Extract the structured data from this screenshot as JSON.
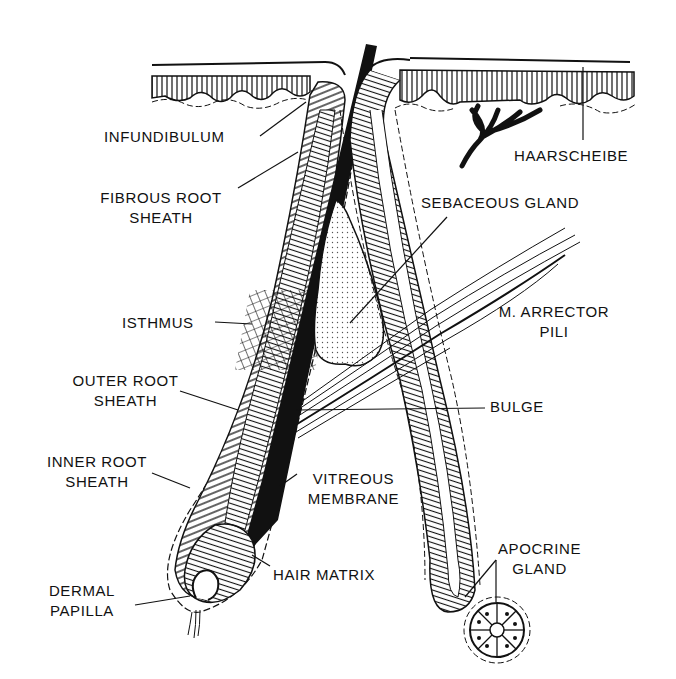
{
  "figure": {
    "colors": {
      "ink": "#111111",
      "background": "#ffffff",
      "stipple": "#555555"
    }
  },
  "labels": {
    "infundibulum": "INFUNDIBULUM",
    "fibrous_root_sheath": [
      "FIBROUS ROOT",
      "SHEATH"
    ],
    "isthmus": "ISTHMUS",
    "outer_root_sheath": [
      "OUTER ROOT",
      "SHEATH"
    ],
    "inner_root_sheath": [
      "INNER ROOT",
      "SHEATH"
    ],
    "dermal_papilla": [
      "DERMAL",
      "PAPILLA"
    ],
    "haarscheibe": "HAARSCHEIBE",
    "sebaceous_gland": "SEBACEOUS GLAND",
    "arrector_pili": [
      "M. ARRECTOR",
      "PILI"
    ],
    "bulge": "BULGE",
    "vitreous_membrane": [
      "VITREOUS",
      "MEMBRANE"
    ],
    "hair_matrix": "HAIR MATRIX",
    "apocrine_gland": [
      "APOCRINE",
      "GLAND"
    ]
  }
}
